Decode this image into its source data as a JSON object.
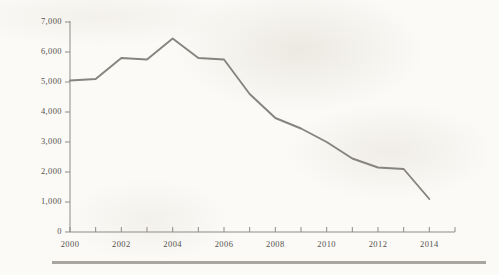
{
  "figure": {
    "background_color": "#fbfaf7",
    "line_color": "#878480",
    "axis_color": "#8e8b87",
    "text_color": "#55514d",
    "rule_color": "#a9a6a2"
  },
  "chart_data": {
    "type": "line",
    "title": "",
    "subtitle": "",
    "xlabel": "",
    "ylabel": "",
    "xlim": [
      2000,
      2015
    ],
    "ylim": [
      0,
      7000
    ],
    "grid": false,
    "legend": "none",
    "y_ticks": [
      0,
      1000,
      2000,
      3000,
      4000,
      5000,
      6000,
      7000
    ],
    "y_tick_labels": [
      "0",
      "1,000",
      "2,000",
      "3,000",
      "4,000",
      "5,000",
      "6,000",
      "7,000"
    ],
    "x_ticks": [
      2000,
      2001,
      2002,
      2003,
      2004,
      2005,
      2006,
      2007,
      2008,
      2009,
      2010,
      2011,
      2012,
      2013,
      2014,
      2015
    ],
    "x_tick_labels_shown": [
      "2000",
      "2002",
      "2004",
      "2006",
      "2008",
      "2010",
      "2012",
      "2014"
    ],
    "x_tick_label_step": 2,
    "x": [
      2000,
      2001,
      2002,
      2003,
      2004,
      2005,
      2006,
      2007,
      2008,
      2009,
      2010,
      2011,
      2012,
      2013,
      2014
    ],
    "values": [
      5050,
      5100,
      5800,
      5750,
      6450,
      5800,
      5750,
      4600,
      3800,
      3450,
      3000,
      2450,
      2150,
      2100,
      1100
    ],
    "series": [
      {
        "name": "series-1",
        "values": [
          5050,
          5100,
          5800,
          5750,
          6450,
          5800,
          5750,
          4600,
          3800,
          3450,
          3000,
          2450,
          2150,
          2100,
          1100
        ]
      }
    ]
  }
}
